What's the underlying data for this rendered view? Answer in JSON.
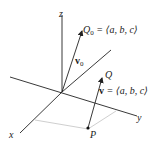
{
  "diagram": {
    "axes": {
      "x_label": "x",
      "y_label": "y",
      "z_label": "z"
    },
    "points": {
      "Q0_label": "Q",
      "Q0_sub": "0",
      "Q0_eq": "= ⟨a, b, c⟩",
      "Q_label": "Q",
      "P_label": "P"
    },
    "vectors": {
      "v0_label": "v",
      "v0_sub": "0",
      "v_label": "v",
      "v_eq": "= ⟨a, b, c⟩"
    },
    "colors": {
      "line": "#222222",
      "projection": "#c8c8c8"
    }
  }
}
